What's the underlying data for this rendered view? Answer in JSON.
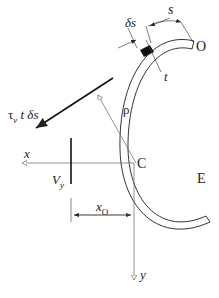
{
  "figure": {
    "labels": {
      "s": "s",
      "delta_s": "δs",
      "O": "O",
      "t": "t",
      "shear_force_element": "τ",
      "shear_sub": "v",
      "shear_rest": " t δs",
      "rho": "ρ",
      "x_axis": "x",
      "C": "C",
      "E": "E",
      "V": "V",
      "V_sub": "y",
      "x_offset": "x",
      "x_offset_sub": "O",
      "y_axis": "y"
    },
    "colors": {
      "line": "#222222",
      "thin_line": "#666666",
      "element_fill": "#111111"
    }
  }
}
